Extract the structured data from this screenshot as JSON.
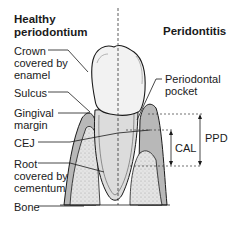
{
  "titles": {
    "left": [
      "Healthy",
      "periodontium"
    ],
    "right": "Peridontitis"
  },
  "labels": {
    "crown": [
      "Crown",
      "covered by",
      "enamel"
    ],
    "sulcus": "Sulcus",
    "gingival_margin": [
      "Gingival",
      "margin"
    ],
    "cej": "CEJ",
    "root": [
      "Root",
      "covered by",
      "cementum"
    ],
    "bone": "Bone",
    "periodontal_pocket": [
      "Periodontal",
      "pocket"
    ],
    "cal": "CAL",
    "ppd": "PPD"
  },
  "colors": {
    "outline": "#1a1a1a",
    "tooth": "#f2f2f2",
    "gingiva": "#b8b8b8",
    "gingiva_inner": "#d6d6d6",
    "bone": "#e2e2e2"
  }
}
